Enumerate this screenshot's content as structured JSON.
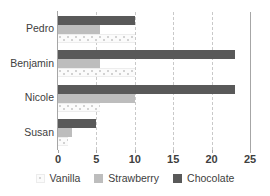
{
  "chart_data": {
    "type": "bar",
    "orientation": "horizontal",
    "title": "",
    "xlabel": "",
    "ylabel": "",
    "categories": [
      "Pedro",
      "Benjamin",
      "Nicole",
      "Susan"
    ],
    "series": [
      {
        "name": "Vanilla",
        "color": "#fbfbfb",
        "values": [
          10,
          10,
          5.5,
          1.3
        ]
      },
      {
        "name": "Strawberry",
        "color": "#bdbdbd",
        "values": [
          5.5,
          5.5,
          10,
          1.8
        ]
      },
      {
        "name": "Chocolate",
        "color": "#595959",
        "values": [
          10,
          23,
          23,
          5
        ]
      }
    ],
    "xlim": [
      0,
      25
    ],
    "xticks": [
      0,
      5,
      10,
      15,
      20,
      25
    ],
    "xtick_labels": [
      "0",
      "5",
      "10",
      "15",
      "20",
      "25"
    ],
    "grid": true,
    "grid_axis": "x",
    "legend_position": "bottom"
  },
  "axis": {
    "ticks": [
      {
        "value": 0,
        "label": "0"
      },
      {
        "value": 5,
        "label": "5"
      },
      {
        "value": 10,
        "label": "10"
      },
      {
        "value": 15,
        "label": "15"
      },
      {
        "value": 20,
        "label": "20"
      },
      {
        "value": 25,
        "label": "25"
      }
    ]
  },
  "legend": {
    "items": [
      {
        "label": "Vanilla",
        "swatch": "vanilla"
      },
      {
        "label": "Strawberry",
        "swatch": "strawberry"
      },
      {
        "label": "Chocolate",
        "swatch": "chocolate"
      }
    ]
  },
  "colors": {
    "chocolate": "#595959",
    "strawberry": "#bdbdbd",
    "vanilla": "#fbfbfb",
    "grid": "#c9c9c9",
    "axis": "#a6a6a6",
    "text": "#404040",
    "background": "#ffffff"
  }
}
